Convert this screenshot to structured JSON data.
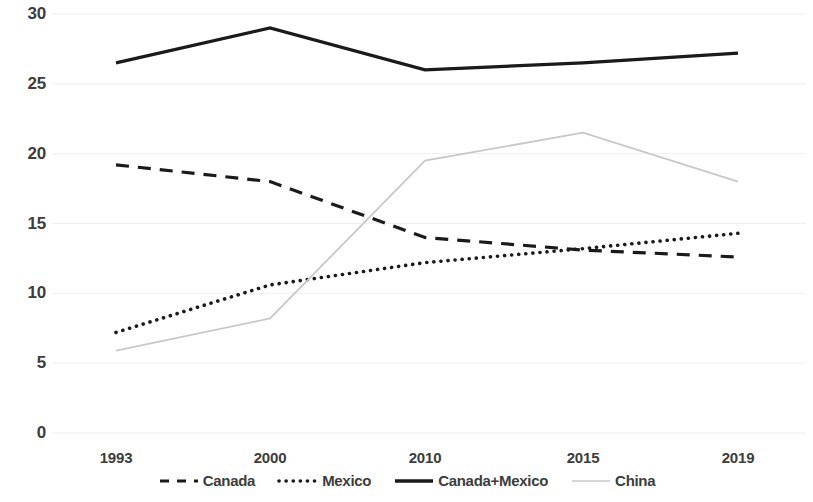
{
  "chart_data": {
    "type": "line",
    "title": "",
    "subtitle": "",
    "xlabel": "",
    "ylabel": "",
    "categories": [
      "1993",
      "2000",
      "2010",
      "2015",
      "2019"
    ],
    "ylim": [
      0,
      30
    ],
    "y_ticks": [
      "0",
      "5",
      "10",
      "15",
      "20",
      "25",
      "30"
    ],
    "grid": true,
    "legend_position": "bottom",
    "series": [
      {
        "name": "Canada",
        "style": "dashed",
        "color": "#1a1a1a",
        "values": [
          19.2,
          18.0,
          14.0,
          13.1,
          12.6
        ]
      },
      {
        "name": "Mexico",
        "style": "dotted",
        "color": "#1a1a1a",
        "values": [
          7.2,
          10.6,
          12.2,
          13.2,
          14.3
        ]
      },
      {
        "name": "Canada+Mexico",
        "style": "solid",
        "color": "#1a1a1a",
        "values": [
          26.5,
          29.0,
          26.0,
          26.5,
          27.2
        ]
      },
      {
        "name": "China",
        "style": "solid-light",
        "color": "#c8c8c8",
        "values": [
          5.9,
          8.2,
          19.5,
          21.5,
          18.0
        ]
      }
    ]
  },
  "legend": {
    "items": [
      {
        "label": "Canada",
        "swatch": "dashed-line-swatch"
      },
      {
        "label": "Mexico",
        "swatch": "dotted-line-swatch"
      },
      {
        "label": "Canada+Mexico",
        "swatch": "solid-line-swatch"
      },
      {
        "label": "China",
        "swatch": "light-line-swatch"
      }
    ]
  },
  "axes": {
    "y_ticks": [
      "30",
      "25",
      "20",
      "15",
      "10",
      "5",
      "0"
    ],
    "x_ticks": [
      "1993",
      "2000",
      "2010",
      "2015",
      "2019"
    ]
  },
  "colors": {
    "series_dark": "#1a1a1a",
    "series_light": "#c8c8c8",
    "grid": "#f0f0f0",
    "text": "#3c3c3c"
  }
}
